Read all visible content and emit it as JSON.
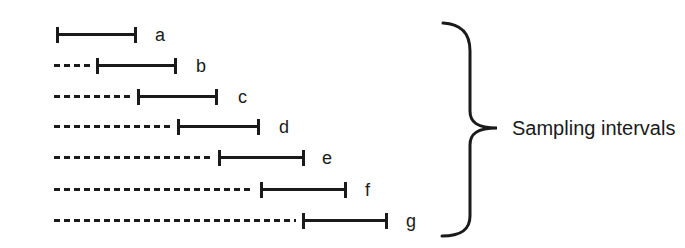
{
  "diagram": {
    "annotation": "Sampling intervals",
    "rows": [
      {
        "label": "a",
        "has_dashed_lead": false,
        "interval_start_px": 56,
        "interval_end_px": 137
      },
      {
        "label": "b",
        "has_dashed_lead": true,
        "interval_start_px": 96,
        "interval_end_px": 177
      },
      {
        "label": "c",
        "has_dashed_lead": true,
        "interval_start_px": 137,
        "interval_end_px": 218
      },
      {
        "label": "d",
        "has_dashed_lead": true,
        "interval_start_px": 177,
        "interval_end_px": 260
      },
      {
        "label": "e",
        "has_dashed_lead": true,
        "interval_start_px": 218,
        "interval_end_px": 305
      },
      {
        "label": "f",
        "has_dashed_lead": true,
        "interval_start_px": 260,
        "interval_end_px": 347
      },
      {
        "label": "g",
        "has_dashed_lead": true,
        "interval_start_px": 302,
        "interval_end_px": 388
      }
    ],
    "dashed_lead_origin_px": 54,
    "colors": {
      "ink": "#1a1a1a",
      "background": "#ffffff"
    }
  }
}
